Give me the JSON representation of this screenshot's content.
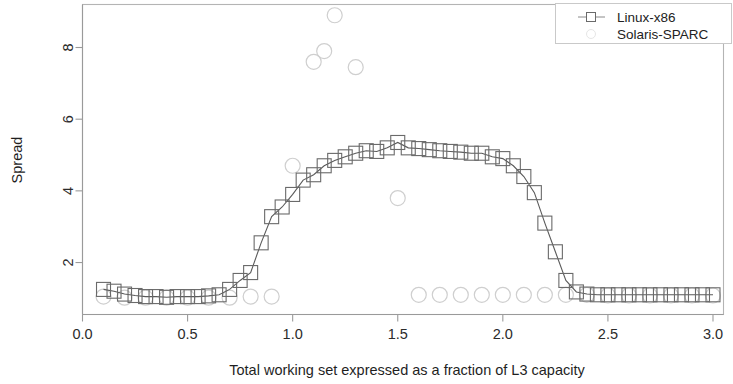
{
  "chart_data": {
    "type": "scatter",
    "title": "",
    "subtitle": "",
    "xlabel": "Total working set expressed as a fraction of L3 capacity",
    "ylabel": "Spread",
    "xlim": [
      0.0,
      3.05
    ],
    "ylim": [
      0.55,
      9.2
    ],
    "xticks": [
      0.0,
      0.5,
      1.0,
      1.5,
      2.0,
      2.5,
      3.0
    ],
    "xtick_labels": [
      "0.0",
      "0.5",
      "1.0",
      "1.5",
      "2.0",
      "2.5",
      "3.0"
    ],
    "yticks": [
      2,
      4,
      6,
      8
    ],
    "ytick_labels": [
      "2",
      "4",
      "6",
      "8"
    ],
    "grid": false,
    "legend_position": "top-right",
    "series": [
      {
        "name": "Linux-x86",
        "marker": "square",
        "line": true,
        "color": "#6a6a6a",
        "x": [
          0.1,
          0.15,
          0.2,
          0.25,
          0.3,
          0.35,
          0.4,
          0.45,
          0.5,
          0.55,
          0.6,
          0.65,
          0.7,
          0.75,
          0.8,
          0.85,
          0.9,
          0.95,
          1.0,
          1.05,
          1.1,
          1.15,
          1.2,
          1.25,
          1.3,
          1.35,
          1.4,
          1.45,
          1.5,
          1.55,
          1.6,
          1.65,
          1.7,
          1.75,
          1.8,
          1.85,
          1.9,
          1.95,
          2.0,
          2.05,
          2.1,
          2.15,
          2.2,
          2.25,
          2.3,
          2.35,
          2.4,
          2.45,
          2.5,
          2.55,
          2.6,
          2.65,
          2.7,
          2.75,
          2.8,
          2.85,
          2.9,
          2.95,
          3.0
        ],
        "y": [
          1.25,
          1.2,
          1.12,
          1.08,
          1.05,
          1.05,
          1.03,
          1.05,
          1.05,
          1.05,
          1.07,
          1.1,
          1.25,
          1.5,
          1.72,
          2.55,
          3.28,
          3.55,
          3.9,
          4.3,
          4.45,
          4.7,
          4.85,
          4.95,
          5.05,
          5.12,
          5.1,
          5.2,
          5.35,
          5.2,
          5.18,
          5.15,
          5.12,
          5.1,
          5.08,
          5.05,
          5.05,
          4.95,
          4.9,
          4.7,
          4.4,
          3.95,
          3.1,
          2.3,
          1.5,
          1.18,
          1.12,
          1.1,
          1.1,
          1.1,
          1.1,
          1.1,
          1.1,
          1.1,
          1.1,
          1.1,
          1.1,
          1.1,
          1.1
        ]
      },
      {
        "name": "Solaris-SPARC",
        "marker": "circle",
        "line": false,
        "color": "#cfcfcf",
        "x": [
          0.1,
          0.2,
          0.3,
          0.4,
          0.5,
          0.6,
          0.7,
          0.8,
          0.9,
          1.0,
          1.1,
          1.15,
          1.2,
          1.3,
          1.5,
          1.6,
          1.7,
          1.8,
          1.9,
          2.0,
          2.1,
          2.2,
          2.3,
          2.4,
          2.5,
          2.6,
          2.7,
          2.8,
          2.9,
          3.0
        ],
        "y": [
          1.05,
          1.02,
          1.02,
          1.02,
          1.02,
          1.02,
          1.02,
          1.05,
          1.05,
          4.7,
          7.6,
          7.9,
          8.9,
          7.45,
          3.8,
          1.1,
          1.1,
          1.1,
          1.1,
          1.1,
          1.1,
          1.1,
          1.1,
          1.1,
          1.08,
          1.08,
          1.08,
          1.08,
          1.08,
          1.08
        ]
      }
    ],
    "legend": [
      {
        "label": "Linux-x86",
        "marker": "square-line"
      },
      {
        "label": "Solaris-SPARC",
        "marker": "circle"
      }
    ]
  }
}
